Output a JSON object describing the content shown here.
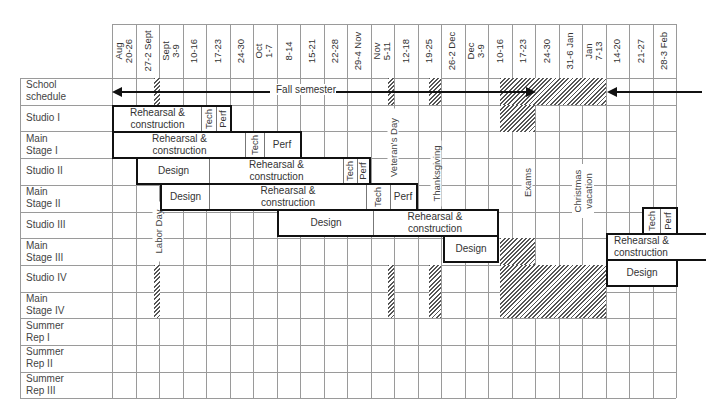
{
  "columns": [
    "Aug\n20-26",
    "27-2 Sept",
    "Sept\n3-9",
    "10-16",
    "17-23",
    "24-30",
    "Oct\n1-7",
    "8-14",
    "15-21",
    "22-28",
    "29-4 Nov",
    "Nov\n5-11",
    "12-18",
    "19-25",
    "26-2 Dec",
    "Dec\n3-9",
    "10-16",
    "17-23",
    "24-30",
    "31-6 Jan",
    "Jan\n7-13",
    "14-20",
    "21-27",
    "28-3 Feb"
  ],
  "rows": [
    "School\nschedule",
    "Studio I",
    "Main\nStage I",
    "Studio II",
    "Main\nStage II",
    "Studio III",
    "Main\nStage III",
    "Studio IV",
    "Main\nStage IV",
    "Summer\nRep I",
    "Summer\nRep II",
    "Summer\nRep III"
  ],
  "school_schedule": {
    "fall_semester_label": "Fall semester"
  },
  "holidays": {
    "labor_day": "Labor Day",
    "veterans_day": "Veteran's Day",
    "thanksgiving": "Thanksgiving",
    "exams": "Exams",
    "christmas": "Christmas\nvacation"
  },
  "bars": {
    "studio_1": {
      "rehearsal": "Rehearsal &\nconstruction",
      "tech": "Tech",
      "perf": "Perf"
    },
    "main_stage_1": {
      "rehearsal": "Rehearsal &\nconstruction",
      "tech": "Tech",
      "perf": "Perf"
    },
    "studio_2": {
      "design": "Design",
      "rehearsal": "Rehearsal &\nconstruction",
      "tech": "Tech",
      "perf": "Perf"
    },
    "main_stage_2": {
      "design": "Design",
      "rehearsal": "Rehearsal &\nconstruction",
      "tech": "Tech",
      "perf": "Perf"
    },
    "studio_3": {
      "design": "Design",
      "rehearsal": "Rehearsal &\nconstruction",
      "tech": "Tech",
      "perf": "Perf"
    },
    "main_stage_3": {
      "design": "Design",
      "rehearsal": "Rehearsal &\nconstruction"
    },
    "studio_4": {
      "design": "Design"
    }
  }
}
